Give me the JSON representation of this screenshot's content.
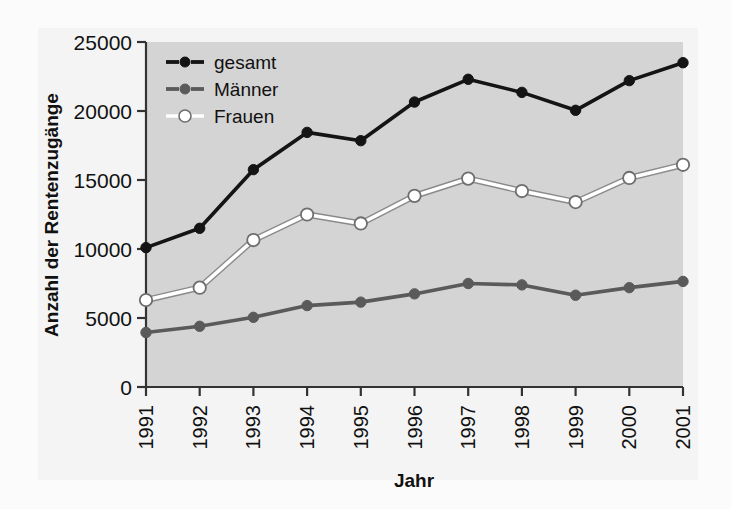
{
  "chart_data": {
    "type": "line",
    "title": "",
    "xlabel": "Jahr",
    "ylabel": "Anzahl der Rentenzugänge",
    "categories": [
      "1991",
      "1992",
      "1993",
      "1994",
      "1995",
      "1996",
      "1997",
      "1998",
      "1999",
      "2000",
      "2001"
    ],
    "x": [
      1991,
      1992,
      1993,
      1994,
      1995,
      1996,
      1997,
      1998,
      1999,
      2000,
      2001
    ],
    "ylim": [
      0,
      25000
    ],
    "yticks": [
      0,
      5000,
      10000,
      15000,
      20000,
      25000
    ],
    "ytick_labels": [
      "0",
      "5000",
      "10000",
      "15000",
      "20000",
      "25000"
    ],
    "grid": false,
    "legend_position": "top-left-inside",
    "series": [
      {
        "name": "gesamt",
        "color": "#141414",
        "marker": "filled-circle",
        "values": [
          10100,
          11500,
          15750,
          18450,
          17850,
          20650,
          22300,
          21350,
          20050,
          22200,
          23500
        ]
      },
      {
        "name": "Männer",
        "color": "#5a5a5a",
        "marker": "filled-circle",
        "values": [
          3950,
          4400,
          5050,
          5900,
          6150,
          6750,
          7500,
          7400,
          6650,
          7200,
          7650
        ]
      },
      {
        "name": "Frauen",
        "color": "#ffffff",
        "marker": "open-circle",
        "values": [
          6300,
          7200,
          10650,
          12500,
          11850,
          13850,
          15100,
          14200,
          13400,
          15150,
          16100
        ]
      }
    ]
  },
  "legend": {
    "items": [
      {
        "label": "gesamt"
      },
      {
        "label": "Männer"
      },
      {
        "label": "Frauen"
      }
    ]
  },
  "axes": {
    "y_axis_title": "Anzahl der Rentenzugänge",
    "x_axis_title": "Jahr"
  },
  "colors": {
    "gesamt": "#141414",
    "maenner": "#5a5a5a",
    "frauen": "#ffffff",
    "plot_background": "#d4d4d4",
    "page_background": "#f4f4f4",
    "axis": "#333333"
  }
}
